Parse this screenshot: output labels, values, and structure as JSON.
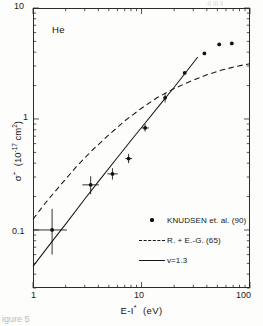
{
  "figure": {
    "caption": "igure 5",
    "scan_artifact": "-|| ||| ||",
    "species_label": "He"
  },
  "axes": {
    "x": {
      "label": "E-I* (eV)",
      "label_base": "E-I",
      "label_sup": "*",
      "label_unit": "(eV)",
      "ticks": [
        "1",
        "10",
        "100"
      ],
      "scale": "log",
      "min": 1,
      "max": 100
    },
    "y": {
      "label": "σ⁺ (10⁻¹⁷ cm²)",
      "label_base": "σ",
      "label_sup": "+",
      "label_unit": "(10",
      "label_exp": "-17",
      "label_unit2": " cm",
      "label_exp2": "2",
      "label_close": ")",
      "ticks": [
        "10",
        "1",
        "0.1"
      ],
      "scale": "log",
      "min": 0.03,
      "max": 10
    }
  },
  "legend": {
    "entries": [
      {
        "key": "dot",
        "label": "KNUDSEN et. al. (90)"
      },
      {
        "key": "dash",
        "label": "R. + E.-G. (65)"
      },
      {
        "key": "solid",
        "label": "v=1.3"
      }
    ]
  },
  "colors": {
    "axis": "#2b2b2b",
    "data": "#101010",
    "curve_solid": "#171717",
    "curve_dashed": "#171717",
    "background": "#fdfdfc"
  },
  "chart_data": {
    "type": "scatter",
    "title": "",
    "subtitle": "",
    "xlabel": "E-I* (eV)",
    "ylabel": "σ⁺ (10⁻¹⁷ cm²)",
    "xscale": "log",
    "yscale": "log",
    "xlim": [
      1,
      100
    ],
    "ylim": [
      0.03,
      10
    ],
    "grid": false,
    "legend_position": "lower-right",
    "annotations": [
      {
        "text": "He",
        "x": 1.9,
        "y": 5.2
      }
    ],
    "series": [
      {
        "name": "KNUDSEN et. al. (90)",
        "type": "scatter",
        "marker": "filled-circle",
        "points": [
          {
            "x": 1.5,
            "y": 0.1,
            "xerr_lo": 0.5,
            "xerr_hi": 0.55,
            "yerr_lo": 0.04,
            "yerr_hi": 0.055
          },
          {
            "x": 3.4,
            "y": 0.255,
            "xerr_lo": 0.55,
            "xerr_hi": 0.65,
            "yerr_lo": 0.045,
            "yerr_hi": 0.05
          },
          {
            "x": 5.4,
            "y": 0.32,
            "xerr_lo": 0.55,
            "xerr_hi": 0.65,
            "yerr_lo": 0.035,
            "yerr_hi": 0.04
          },
          {
            "x": 7.6,
            "y": 0.44,
            "xerr_lo": 0.5,
            "xerr_hi": 0.6,
            "yerr_lo": 0.04,
            "yerr_hi": 0.045
          },
          {
            "x": 10.8,
            "y": 0.83,
            "xerr_lo": 0.8,
            "xerr_hi": 0.9,
            "yerr_lo": 0.06,
            "yerr_hi": 0.07
          },
          {
            "x": 16.5,
            "y": 1.55,
            "xerr_lo": 0.0,
            "xerr_hi": 0.0,
            "yerr_lo": 0.14,
            "yerr_hi": 0.15
          },
          {
            "x": 25.0,
            "y": 2.6,
            "xerr_lo": 0.0,
            "xerr_hi": 0.0,
            "yerr_lo": 0.0,
            "yerr_hi": 0.0
          },
          {
            "x": 38.0,
            "y": 3.9,
            "xerr_lo": 0.0,
            "xerr_hi": 0.0,
            "yerr_lo": 0.0,
            "yerr_hi": 0.0
          },
          {
            "x": 52.0,
            "y": 4.7,
            "xerr_lo": 0.0,
            "xerr_hi": 0.0,
            "yerr_lo": 0.0,
            "yerr_hi": 0.0
          },
          {
            "x": 68.0,
            "y": 4.8,
            "xerr_lo": 0.0,
            "xerr_hi": 0.0,
            "yerr_lo": 0.0,
            "yerr_hi": 0.0
          }
        ]
      },
      {
        "name": "R. + E.-G. (65)",
        "type": "line",
        "style": "dashed",
        "x": [
          1.0,
          1.3,
          1.8,
          2.5,
          3.5,
          5.0,
          7.0,
          10.0,
          14.0,
          20.0,
          28.0,
          40.0,
          55.0,
          75.0,
          100.0
        ],
        "y": [
          0.125,
          0.175,
          0.255,
          0.37,
          0.52,
          0.72,
          0.96,
          1.25,
          1.56,
          1.88,
          2.18,
          2.5,
          2.76,
          2.98,
          3.15
        ]
      },
      {
        "name": "v=1.3",
        "type": "line",
        "style": "solid",
        "x": [
          1.0,
          1.5,
          2.0,
          3.0,
          4.0,
          6.0,
          8.0,
          11.0,
          15.0,
          20.0,
          26.0,
          33.0
        ],
        "y": [
          0.047,
          0.079,
          0.113,
          0.19,
          0.273,
          0.45,
          0.64,
          0.94,
          1.37,
          1.93,
          2.68,
          3.62
        ]
      }
    ]
  }
}
